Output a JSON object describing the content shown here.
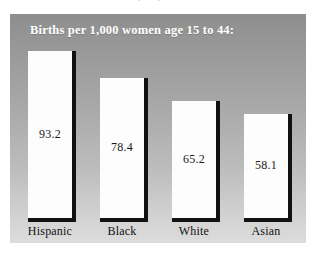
{
  "source_caption": "Source: U.S. Statistical Abstract (1999).",
  "chart": {
    "title": "Births per 1,000 women age 15 to 44:"
  },
  "chart_data": {
    "type": "bar",
    "title": "Births per 1,000 women age 15 to 44:",
    "xlabel": "",
    "ylabel": "Births per 1,000 women age 15 to 44",
    "categories": [
      "Hispanic",
      "Black",
      "White",
      "Asian"
    ],
    "values": [
      93.2,
      78.4,
      65.2,
      58.1
    ],
    "value_labels": [
      "93.2",
      "78.4",
      "65.2",
      "58.1"
    ],
    "ylim": [
      0,
      100
    ],
    "grid": false,
    "legend": null,
    "bar_color": "#fdfdfd",
    "bar_shadow_color": "#111111",
    "panel_background": "#a8a8a8",
    "title_color": "#ffffff",
    "label_color": "#111111"
  }
}
